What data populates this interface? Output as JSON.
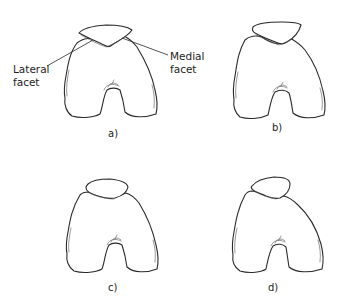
{
  "figure": {
    "panels": [
      {
        "id": "a",
        "label": "a)",
        "patella_shape": "wide flattened, centered, deep V underside"
      },
      {
        "id": "b",
        "label": "b)",
        "patella_shape": "tilted, V underside"
      },
      {
        "id": "c",
        "label": "c)",
        "patella_shape": "small ovoid"
      },
      {
        "id": "d",
        "label": "d)",
        "patella_shape": "small, lateralized and tilted"
      }
    ],
    "annotations": {
      "lateral_line1": "Lateral",
      "lateral_line2": "facet",
      "medial_line1": "Medial",
      "medial_line2": "facet"
    },
    "colors": {
      "stroke": "#2a2a2a",
      "background": "#ffffff"
    }
  }
}
